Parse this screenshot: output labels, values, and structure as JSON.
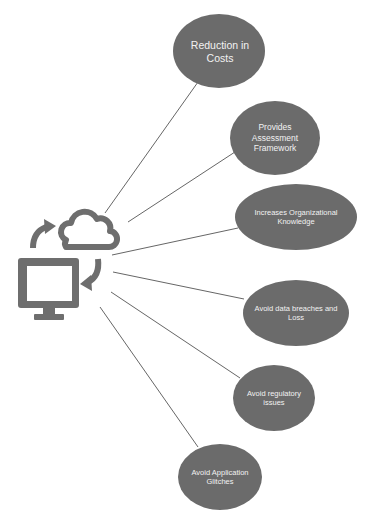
{
  "colors": {
    "ellipse_fill": "#6b6b6b",
    "line": "#666666",
    "icon": "#6e6e6e",
    "label": "#f2f2f2",
    "background": "#ffffff"
  },
  "hub": {
    "icons": [
      "computer-monitor-icon",
      "cloud-icon",
      "sync-arrow-up-icon",
      "sync-arrow-down-icon"
    ]
  },
  "nodes": [
    {
      "id": "reduction-in-costs",
      "label": "Reduction in Costs",
      "lines": [
        "Reduction in",
        "Costs"
      ]
    },
    {
      "id": "provides-assessment-framework",
      "label": "Provides Assessment Framework",
      "lines": [
        "Provides",
        "Assessment",
        "Framework"
      ]
    },
    {
      "id": "increases-organizational-knowledge",
      "label": "Increases Organizational Knowledge",
      "lines": [
        "Increases Organizational",
        "Knowledge"
      ]
    },
    {
      "id": "avoid-data-breaches",
      "label": "Avoid data breaches and Loss",
      "lines": [
        "Avoid data breaches and",
        "Loss"
      ]
    },
    {
      "id": "avoid-regulatory-issues",
      "label": "Avoid regulatory issues",
      "lines": [
        "Avoid regulatory",
        "issues"
      ]
    },
    {
      "id": "avoid-application-glitches",
      "label": "Avoid Application Glitches",
      "lines": [
        "Avoid Application",
        "Glitches"
      ]
    }
  ]
}
